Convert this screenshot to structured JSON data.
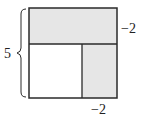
{
  "diagram": {
    "type": "area-model-square",
    "labels": {
      "left_brace": "5",
      "right_top": "−2",
      "bottom_right": "−2"
    },
    "colors": {
      "shade": "#e6e6e6",
      "line": "#2a2a2a",
      "background": "#ffffff"
    },
    "regions": [
      {
        "name": "top-strip",
        "shaded": true
      },
      {
        "name": "bottom-left-square",
        "shaded": false
      },
      {
        "name": "bottom-right-rect",
        "shaded": true
      }
    ]
  }
}
